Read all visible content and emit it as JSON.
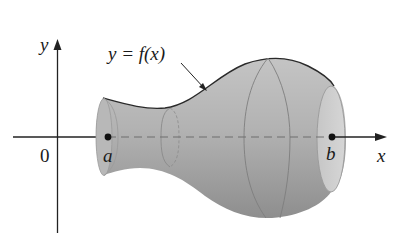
{
  "figure": {
    "type": "solid of revolution",
    "axes": {
      "x_label": "x",
      "y_label": "y",
      "origin_label": "0"
    },
    "curve_label": "y = f(x)",
    "points": [
      {
        "name": "a",
        "label": "a"
      },
      {
        "name": "b",
        "label": "b"
      }
    ],
    "colors": {
      "solid_fill": "#a9a9a9",
      "solid_dark": "#8c8c8c",
      "end_cap_fill": "#cdcdcd",
      "outline": "#2a2a2a",
      "axis": "#222222"
    }
  }
}
